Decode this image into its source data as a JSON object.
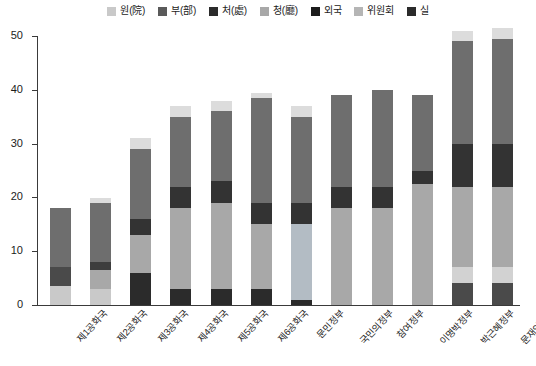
{
  "chart_data": {
    "type": "bar",
    "stacked": true,
    "title": "",
    "xlabel": "",
    "ylabel": "",
    "ylim": [
      0,
      50
    ],
    "yticks": [
      0,
      10,
      20,
      30,
      40,
      50
    ],
    "grid": false,
    "legend_position": "top-center",
    "categories": [
      "제1공화국",
      "제2공화국",
      "제3공화국",
      "제4공화국",
      "제5공화국",
      "제6공화국",
      "문민정부",
      "국민의정부",
      "참여정부",
      "이명박정부",
      "박근혜정부",
      "문재인정부"
    ],
    "series": [
      {
        "name": "원(院)",
        "color": "#c9c9c9",
        "values": [
          3.5,
          3,
          0,
          0,
          0,
          0,
          0,
          0,
          0,
          0,
          3,
          0
        ]
      },
      {
        "name": "부(部)",
        "color": "#5a5a5a",
        "values": [
          3.5,
          3.5,
          6,
          3,
          3,
          3,
          0,
          0,
          0,
          0,
          4,
          4
        ]
      },
      {
        "name": "처(處)",
        "color": "#2b2b2b",
        "values": [
          0,
          0,
          0,
          0,
          0,
          0,
          1,
          0,
          0,
          0,
          0,
          0
        ]
      },
      {
        "name": "청(廳)",
        "color": "#a8a8a8",
        "values": [
          0,
          4,
          7,
          15,
          16,
          12,
          14,
          18,
          18,
          22.5,
          15,
          14
        ]
      },
      {
        "name": "외국",
        "color": "#2b2b2b",
        "values": [
          0,
          0,
          3,
          4,
          4,
          4,
          4,
          4,
          4,
          2.5,
          8,
          8
        ]
      },
      {
        "name": "위원회",
        "color": "#6e6e6e",
        "values": [
          11,
          7.5,
          13,
          13,
          14,
          19.5,
          16,
          17,
          18,
          14,
          19,
          23
        ]
      },
      {
        "name": "실",
        "color": "#dcdcdc",
        "values": [
          0,
          1,
          2,
          2,
          2,
          0.5,
          2,
          0,
          0,
          0,
          2,
          2
        ]
      }
    ],
    "bar_totals": [
      18,
      19.5,
      31,
      37,
      39,
      39.5,
      37,
      39,
      40,
      39,
      51,
      51.5
    ],
    "bar_stacks": [
      [
        {
          "series": "원(院)",
          "from": 0,
          "to": 3.5,
          "color": "#c9c9c9"
        },
        {
          "series": "부(部)",
          "from": 3.5,
          "to": 7,
          "color": "#4a4a4a"
        },
        {
          "series": "위원회",
          "from": 7,
          "to": 18,
          "color": "#6e6e6e"
        }
      ],
      [
        {
          "series": "원(院)",
          "from": 0,
          "to": 3,
          "color": "#c9c9c9"
        },
        {
          "series": "청(廳)",
          "from": 3,
          "to": 6.5,
          "color": "#a8a8a8"
        },
        {
          "series": "부(部)",
          "from": 6.5,
          "to": 8,
          "color": "#3d3d3d"
        },
        {
          "series": "위원회",
          "from": 8,
          "to": 19,
          "color": "#6e6e6e"
        },
        {
          "series": "실",
          "from": 19,
          "to": 19.8,
          "color": "#dcdcdc"
        }
      ],
      [
        {
          "series": "부(部)",
          "from": 0,
          "to": 6,
          "color": "#2b2b2b"
        },
        {
          "series": "청(廳)",
          "from": 6,
          "to": 13,
          "color": "#a8a8a8"
        },
        {
          "series": "외국",
          "from": 13,
          "to": 16,
          "color": "#333333"
        },
        {
          "series": "위원회",
          "from": 16,
          "to": 29,
          "color": "#6e6e6e"
        },
        {
          "series": "실",
          "from": 29,
          "to": 31,
          "color": "#dcdcdc"
        }
      ],
      [
        {
          "series": "부(部)",
          "from": 0,
          "to": 3,
          "color": "#2b2b2b"
        },
        {
          "series": "청(廳)",
          "from": 3,
          "to": 18,
          "color": "#a8a8a8"
        },
        {
          "series": "외국",
          "from": 18,
          "to": 22,
          "color": "#333333"
        },
        {
          "series": "위원회",
          "from": 22,
          "to": 35,
          "color": "#6e6e6e"
        },
        {
          "series": "실",
          "from": 35,
          "to": 37,
          "color": "#dcdcdc"
        }
      ],
      [
        {
          "series": "부(部)",
          "from": 0,
          "to": 3,
          "color": "#2b2b2b"
        },
        {
          "series": "청(廳)",
          "from": 3,
          "to": 19,
          "color": "#a8a8a8"
        },
        {
          "series": "외국",
          "from": 19,
          "to": 23,
          "color": "#333333"
        },
        {
          "series": "위원회",
          "from": 23,
          "to": 36,
          "color": "#6e6e6e"
        },
        {
          "series": "실",
          "from": 36,
          "to": 38,
          "color": "#dcdcdc"
        }
      ],
      [
        {
          "series": "부(部)",
          "from": 0,
          "to": 3,
          "color": "#2b2b2b"
        },
        {
          "series": "청(廳)",
          "from": 3,
          "to": 15,
          "color": "#a8a8a8"
        },
        {
          "series": "외국",
          "from": 15,
          "to": 19,
          "color": "#333333"
        },
        {
          "series": "위원회",
          "from": 19,
          "to": 38.5,
          "color": "#6e6e6e"
        },
        {
          "series": "실",
          "from": 38.5,
          "to": 39.5,
          "color": "#dcdcdc"
        }
      ],
      [
        {
          "series": "처(處)",
          "from": 0,
          "to": 1,
          "color": "#2b2b2b"
        },
        {
          "series": "청(廳)",
          "from": 1,
          "to": 15,
          "color": "#b3bcc4"
        },
        {
          "series": "외국",
          "from": 15,
          "to": 19,
          "color": "#333333"
        },
        {
          "series": "위원회",
          "from": 19,
          "to": 35,
          "color": "#6e6e6e"
        },
        {
          "series": "실",
          "from": 35,
          "to": 37,
          "color": "#dcdcdc"
        }
      ],
      [
        {
          "series": "청(廳)",
          "from": 0,
          "to": 18,
          "color": "#a8a8a8"
        },
        {
          "series": "외국",
          "from": 18,
          "to": 22,
          "color": "#333333"
        },
        {
          "series": "위원회",
          "from": 22,
          "to": 39,
          "color": "#6e6e6e"
        }
      ],
      [
        {
          "series": "청(廳)",
          "from": 0,
          "to": 18,
          "color": "#a8a8a8"
        },
        {
          "series": "외국",
          "from": 18,
          "to": 22,
          "color": "#333333"
        },
        {
          "series": "위원회",
          "from": 22,
          "to": 40,
          "color": "#6e6e6e"
        }
      ],
      [
        {
          "series": "청(廳)",
          "from": 0,
          "to": 22.5,
          "color": "#a8a8a8"
        },
        {
          "series": "외국",
          "from": 22.5,
          "to": 25,
          "color": "#333333"
        },
        {
          "series": "위원회",
          "from": 25,
          "to": 39,
          "color": "#6e6e6e"
        }
      ],
      [
        {
          "series": "부(部)",
          "from": 0,
          "to": 4,
          "color": "#4a4a4a"
        },
        {
          "series": "원(院)",
          "from": 4,
          "to": 7,
          "color": "#d2d2d2"
        },
        {
          "series": "청(廳)",
          "from": 7,
          "to": 22,
          "color": "#a8a8a8"
        },
        {
          "series": "외국",
          "from": 22,
          "to": 30,
          "color": "#333333"
        },
        {
          "series": "위원회",
          "from": 30,
          "to": 49,
          "color": "#6e6e6e"
        },
        {
          "series": "실",
          "from": 49,
          "to": 51,
          "color": "#dcdcdc"
        }
      ],
      [
        {
          "series": "부(部)",
          "from": 0,
          "to": 4,
          "color": "#4a4a4a"
        },
        {
          "series": "원(院)",
          "from": 4,
          "to": 7,
          "color": "#d2d2d2"
        },
        {
          "series": "청(廳)",
          "from": 7,
          "to": 22,
          "color": "#a8a8a8"
        },
        {
          "series": "외국",
          "from": 22,
          "to": 30,
          "color": "#333333"
        },
        {
          "series": "위원회",
          "from": 30,
          "to": 49.5,
          "color": "#6e6e6e"
        },
        {
          "series": "실",
          "from": 49.5,
          "to": 51.5,
          "color": "#dcdcdc"
        }
      ]
    ]
  },
  "legend": {
    "items": [
      {
        "label": "원(院)",
        "color": "#c9c9c9"
      },
      {
        "label": "부(部)",
        "color": "#5a5a5a"
      },
      {
        "label": "처(處)",
        "color": "#2b2b2b"
      },
      {
        "label": "청(廳)",
        "color": "#a8a8a8"
      },
      {
        "label": "외국",
        "color": "#1c1c1c"
      },
      {
        "label": "위원회",
        "color": "#b5b5b5"
      },
      {
        "label": "실",
        "color": "#2b2b2b"
      }
    ]
  },
  "axis": {
    "y_tick_labels": [
      "0",
      "10",
      "20",
      "30",
      "40",
      "50"
    ],
    "x_tick_labels": [
      "제1공화국",
      "제2공화국",
      "제3공화국",
      "제4공화국",
      "제5공화국",
      "제6공화국",
      "문민정부",
      "국민의정부",
      "참여정부",
      "이명박정부",
      "박근혜정부",
      "문재인정부"
    ]
  }
}
